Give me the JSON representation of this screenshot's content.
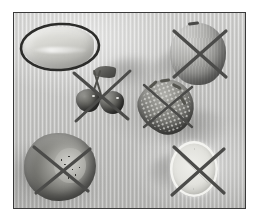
{
  "image": {
    "title": "Annotated fruit photograph",
    "medium": "grayscale photograph",
    "background_description": "light gray striped fabric",
    "frame": {
      "border_color": "#3a3a3a",
      "background_color": "#c6c6c4"
    },
    "annotation_color": "#4b4b49",
    "circle_color": "#2c2c2a"
  },
  "objects": [
    {
      "id": "pale-fruit",
      "label": "pale fruit",
      "annotation": "circle",
      "position": "top-left"
    },
    {
      "id": "apple",
      "label": "apple",
      "annotation": "cross-out",
      "position": "top-right"
    },
    {
      "id": "cherries",
      "label": "cherries",
      "annotation": "cross-out",
      "position": "center-left"
    },
    {
      "id": "strawberry",
      "label": "strawberry",
      "annotation": "cross-out",
      "position": "center-right"
    },
    {
      "id": "kiwi",
      "label": "kiwi",
      "annotation": "cross-out",
      "position": "bottom-left"
    },
    {
      "id": "lemon",
      "label": "lemon slice",
      "annotation": "cross-out",
      "position": "bottom-right"
    }
  ],
  "annotations": {
    "circle_label": "circled item",
    "cross_label": "crossed-out item",
    "circle_count": 1,
    "cross_count": 5
  }
}
